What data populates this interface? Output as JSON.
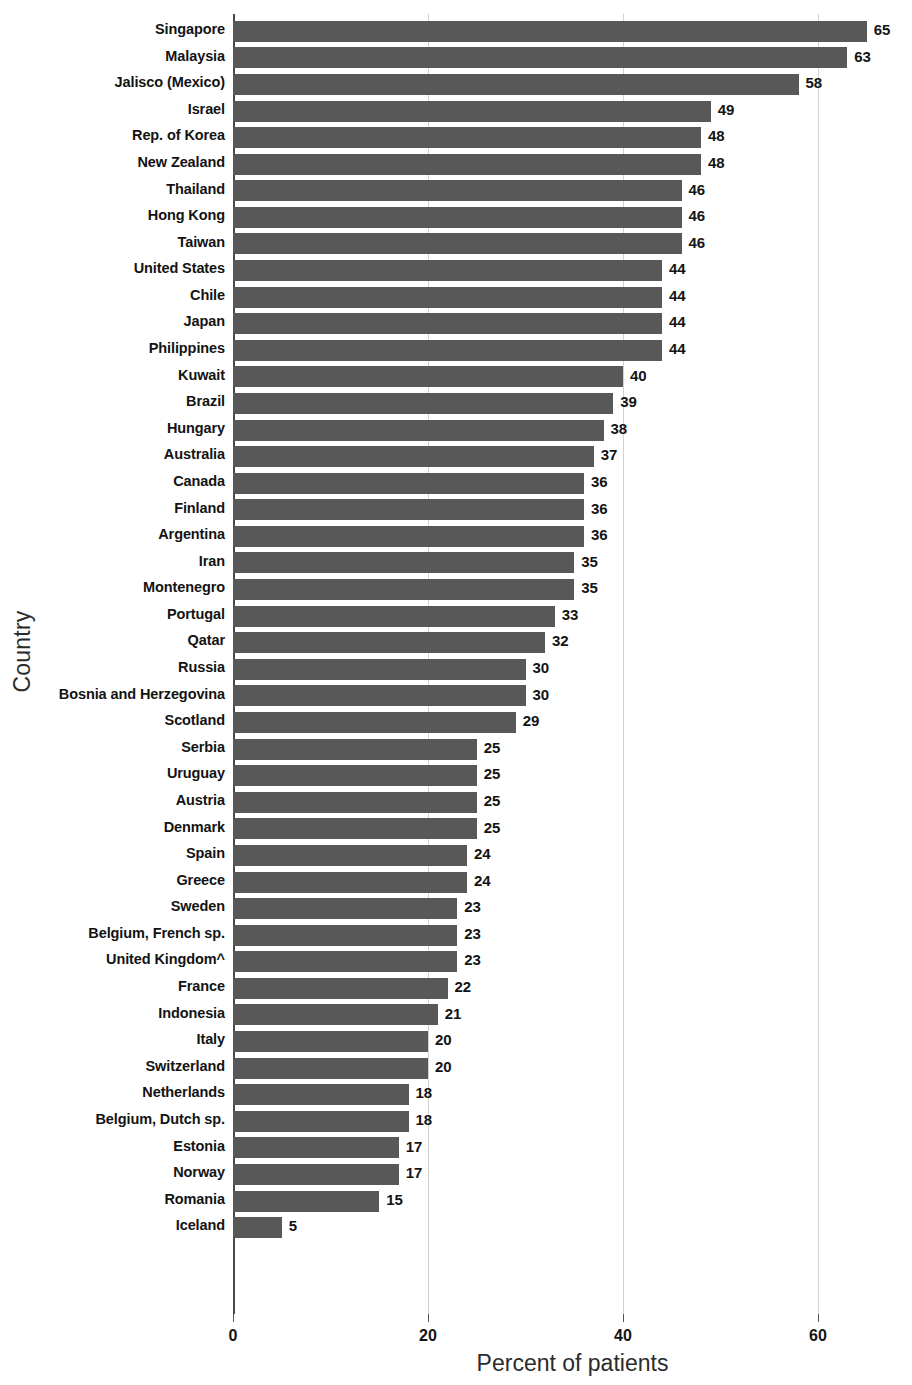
{
  "chart_data": {
    "type": "bar",
    "orientation": "horizontal",
    "title": "",
    "xlabel": "Percent of patients",
    "ylabel": "Country",
    "xlim": [
      0,
      70
    ],
    "xticks": [
      0,
      20,
      40,
      60
    ],
    "xtick_labels": [
      "0",
      "20",
      "40",
      "60"
    ],
    "grid": true,
    "grid_axis": "x",
    "legend": null,
    "bar_color": "#585858",
    "categories": [
      "Singapore",
      "Malaysia",
      "Jalisco (Mexico)",
      "Israel",
      "Rep. of Korea",
      "New Zealand",
      "Thailand",
      "Hong Kong",
      "Taiwan",
      "United States",
      "Chile",
      "Japan",
      "Philippines",
      "Kuwait",
      "Brazil",
      "Hungary",
      "Australia",
      "Canada",
      "Finland",
      "Argentina",
      "Iran",
      "Montenegro",
      "Portugal",
      "Qatar",
      "Russia",
      "Bosnia and Herzegovina",
      "Scotland",
      "Serbia",
      "Uruguay",
      "Austria",
      "Denmark",
      "Spain",
      "Greece",
      "Sweden",
      "Belgium, French sp.",
      "United Kingdom^",
      "France",
      "Indonesia",
      "Italy",
      "Switzerland",
      "Netherlands",
      "Belgium, Dutch sp.",
      "Estonia",
      "Norway",
      "Romania",
      "Iceland"
    ],
    "values": [
      65,
      63,
      58,
      49,
      48,
      48,
      46,
      46,
      46,
      44,
      44,
      44,
      44,
      40,
      39,
      38,
      37,
      36,
      36,
      36,
      35,
      35,
      33,
      32,
      30,
      30,
      29,
      25,
      25,
      25,
      25,
      24,
      24,
      23,
      23,
      23,
      22,
      21,
      20,
      20,
      18,
      18,
      17,
      17,
      15,
      5
    ],
    "value_labels": [
      "65",
      "63",
      "58",
      "49",
      "48",
      "48",
      "46",
      "46",
      "46",
      "44",
      "44",
      "44",
      "44",
      "40",
      "39",
      "38",
      "37",
      "36",
      "36",
      "36",
      "35",
      "35",
      "33",
      "32",
      "30",
      "30",
      "29",
      "25",
      "25",
      "25",
      "25",
      "24",
      "24",
      "23",
      "23",
      "23",
      "22",
      "21",
      "20",
      "20",
      "18",
      "18",
      "17",
      "17",
      "15",
      "5"
    ]
  }
}
